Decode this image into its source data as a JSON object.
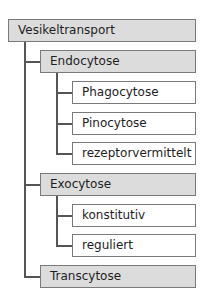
{
  "diagram": {
    "root": {
      "label": "Vesikeltransport"
    },
    "children": [
      {
        "label": "Endocytose",
        "children": [
          {
            "label": "Phagocytose"
          },
          {
            "label": "Pinocytose"
          },
          {
            "label": "rezeptorvermittelt"
          }
        ]
      },
      {
        "label": "Exocytose",
        "children": [
          {
            "label": "konstitutiv"
          },
          {
            "label": "reguliert"
          }
        ]
      },
      {
        "label": "Transcytose"
      }
    ]
  },
  "colors": {
    "parent_fill": "#dcdcdc",
    "leaf_fill": "#ffffff",
    "border": "#7a7a7a",
    "connector": "#555555"
  }
}
